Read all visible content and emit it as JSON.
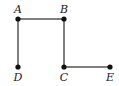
{
  "diagram": {
    "type": "graph",
    "line_color": "#555555",
    "node_color": "#111111",
    "nodes": [
      {
        "id": "A",
        "label": "A",
        "x": 18,
        "y": 19,
        "lx": 18,
        "ly": 13
      },
      {
        "id": "B",
        "label": "B",
        "x": 64,
        "y": 19,
        "lx": 64,
        "ly": 13
      },
      {
        "id": "C",
        "label": "C",
        "x": 64,
        "y": 67,
        "lx": 64,
        "ly": 81
      },
      {
        "id": "D",
        "label": "D",
        "x": 18,
        "y": 67,
        "lx": 18,
        "ly": 81
      },
      {
        "id": "E",
        "label": "E",
        "x": 110,
        "y": 67,
        "lx": 110,
        "ly": 81
      }
    ],
    "edges": [
      [
        "A",
        "B"
      ],
      [
        "A",
        "D"
      ],
      [
        "B",
        "C"
      ],
      [
        "C",
        "E"
      ]
    ]
  }
}
